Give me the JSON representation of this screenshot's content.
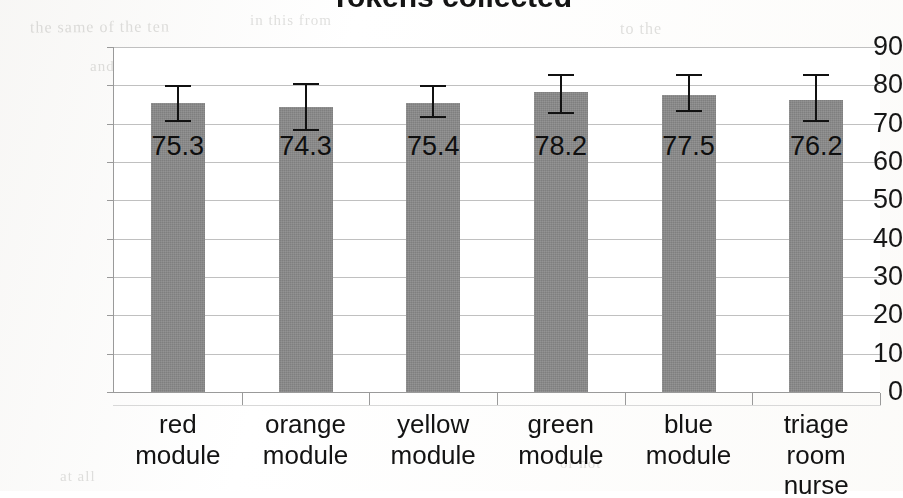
{
  "chart_data": {
    "type": "bar",
    "title": "Tokens collected",
    "xlabel": "",
    "ylabel": "",
    "ylim": [
      0,
      90
    ],
    "ytick_step": 10,
    "ytick_labels": [
      "90",
      "80",
      "70",
      "60",
      "50",
      "40",
      "30",
      "20",
      "10",
      "0"
    ],
    "grid": true,
    "legend": "none",
    "categories": [
      "red module",
      "orange module",
      "yellow module",
      "green module",
      "blue module",
      "triage room nurse"
    ],
    "values": [
      75.3,
      74.3,
      75.4,
      78.2,
      77.5,
      76.2
    ],
    "value_labels": [
      "75.3",
      "74.3",
      "75.4",
      "78.2",
      "77.5",
      "76.2"
    ],
    "error_bars": [
      {
        "low": 71.0,
        "high": 80.0
      },
      {
        "low": 68.5,
        "high": 80.5
      },
      {
        "low": 72.0,
        "high": 80.0
      },
      {
        "low": 73.0,
        "high": 83.0
      },
      {
        "low": 73.5,
        "high": 83.0
      },
      {
        "low": 71.0,
        "high": 83.0
      }
    ],
    "bar_color": "#8a8a8a",
    "gridline_color": "#c0c0c0",
    "axis_color": "#9a9a9a",
    "text_color": "#141414",
    "background_color": "#ffffff"
  },
  "scan_artifacts": {
    "note": "faint bleed-through text from reverse of scanned page",
    "ghosts": [
      "the same of the ten",
      "in this from",
      "to the",
      "and of all",
      "there is a",
      "work on",
      "of time",
      "in the",
      "or not",
      "at all"
    ]
  }
}
